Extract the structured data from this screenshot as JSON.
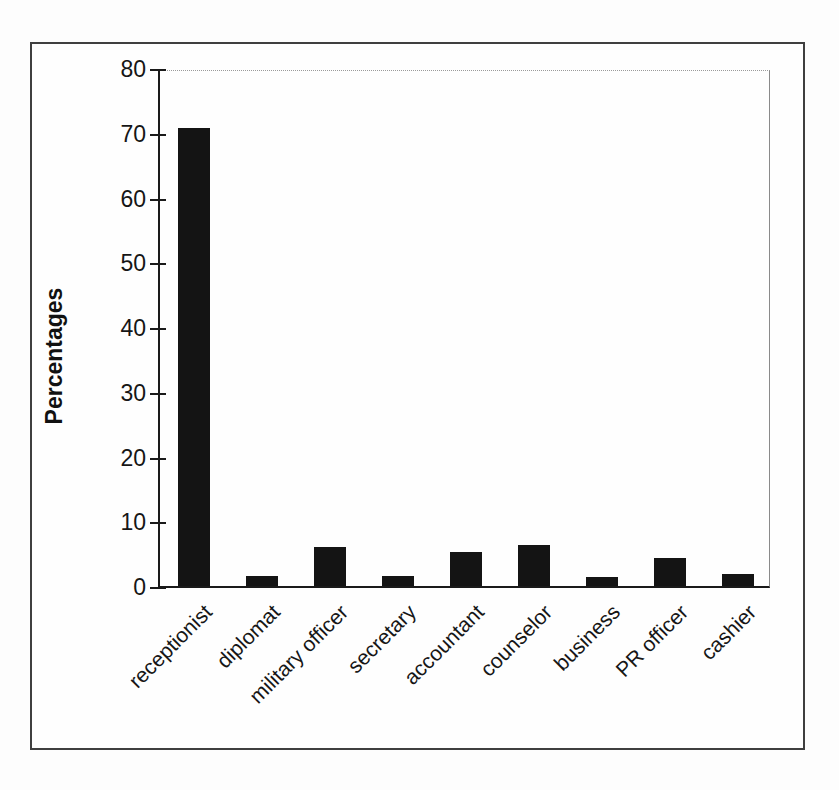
{
  "chart_data": {
    "type": "bar",
    "title": "",
    "categories": [
      "receptionist",
      "diplomat",
      "military officer",
      "secretary",
      "accountant",
      "counselor",
      "business",
      "PR officer",
      "cashier"
    ],
    "values": [
      70.7,
      1.5,
      6.0,
      1.6,
      5.2,
      6.3,
      1.4,
      4.3,
      1.9
    ],
    "xlabel": "",
    "ylabel": "Percentages",
    "ylim": [
      0,
      80
    ],
    "yticks": [
      0,
      10,
      20,
      30,
      40,
      50,
      60,
      70,
      80
    ],
    "bar_color": "#141414",
    "grid": false,
    "legend_position": "none",
    "x_tick_label_rotation_deg": 45
  }
}
